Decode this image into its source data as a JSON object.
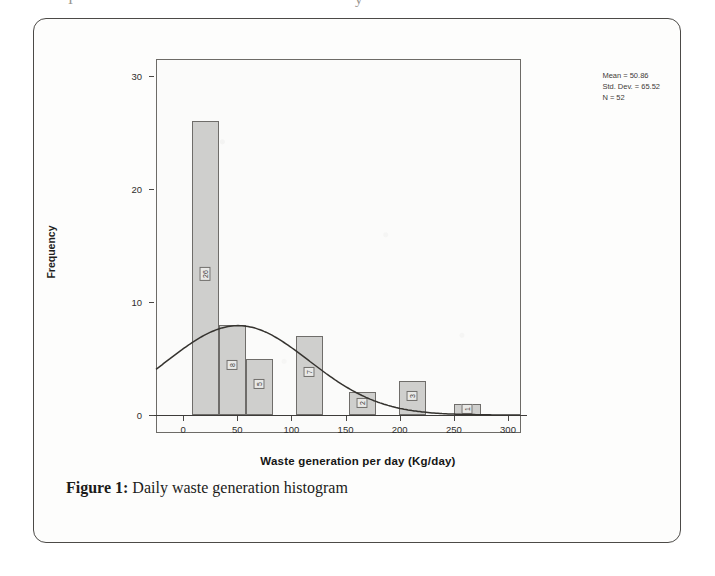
{
  "page": {
    "top_clipped_fragment": "I                                                         y"
  },
  "figure": {
    "caption_label": "Figure 1:",
    "caption_text": " Daily waste generation histogram"
  },
  "stats": {
    "mean": "Mean = 50.86",
    "std_dev": "Std. Dev. = 65.52",
    "n": "N = 52"
  },
  "chart_data": {
    "type": "bar",
    "title": "",
    "subtitle": "",
    "xlabel": "Waste generation per day (Kg/day)",
    "ylabel": "Frequency",
    "xlim": [
      -25,
      312
    ],
    "ylim": [
      0,
      31
    ],
    "grid": false,
    "legend": "none",
    "xticks": [
      0,
      50,
      100,
      150,
      200,
      250,
      300
    ],
    "xtick_labels": [
      "0",
      "50",
      "100",
      "150",
      "200",
      "250",
      "300"
    ],
    "yticks": [
      0,
      10,
      20,
      30
    ],
    "ytick_labels": [
      "0",
      "10",
      "20",
      "30"
    ],
    "bin_width": 25,
    "bar_labels_rotated": true,
    "bins": [
      {
        "x_start": 8,
        "x_end": 33,
        "value": 26,
        "label": "26"
      },
      {
        "x_start": 33,
        "x_end": 58,
        "value": 8,
        "label": "8"
      },
      {
        "x_start": 58,
        "x_end": 83,
        "value": 5,
        "label": "5"
      },
      {
        "x_start": 104,
        "x_end": 129,
        "value": 7,
        "label": "7"
      },
      {
        "x_start": 153,
        "x_end": 178,
        "value": 2,
        "label": "2"
      },
      {
        "x_start": 199,
        "x_end": 224,
        "value": 3,
        "label": "3"
      },
      {
        "x_start": 250,
        "x_end": 275,
        "value": 1,
        "label": "1"
      }
    ],
    "categories": [
      "8-33",
      "33-58",
      "58-83",
      "104-129",
      "153-178",
      "199-224",
      "250-275"
    ],
    "values": [
      26,
      8,
      5,
      7,
      2,
      3,
      1
    ],
    "normal_curve": {
      "shown": true,
      "mean": 50.86,
      "std_dev": 65.52,
      "n": 52,
      "color": "#35332f"
    },
    "colors": {
      "bar_fill": "#cfcfcd",
      "bar_edge": "#6f6d6a",
      "panel_bg": "#fbfbfa",
      "axis": "#3d3b39"
    }
  }
}
